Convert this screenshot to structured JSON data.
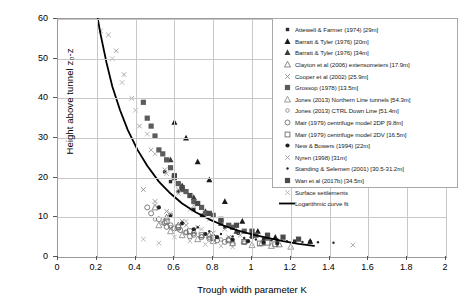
{
  "chart_data": {
    "type": "scatter",
    "title": "",
    "xlabel": "Trough  width  parameter K",
    "ylabel": "Height above tunnel z₀-z",
    "xlim": [
      0,
      2
    ],
    "ylim": [
      0,
      60
    ],
    "xticks": [
      "0",
      "0.2",
      "0.4",
      "0.6",
      "0.8",
      "1",
      "1.2",
      "1.4",
      "1.6",
      "1.8",
      "2"
    ],
    "yticks": [
      "0",
      "10",
      "20",
      "30",
      "40",
      "50",
      "60"
    ],
    "grid": true,
    "legend_position": "top-right",
    "series": [
      {
        "name": "Attewell & Farmer (1974) [29m]",
        "marker": "filled-square-small",
        "color": "#2b2b2b",
        "points": [
          [
            0.62,
            16.5
          ],
          [
            0.7,
            12.0
          ],
          [
            0.74,
            10.5
          ],
          [
            0.86,
            7.5
          ],
          [
            0.93,
            6.0
          ],
          [
            1.0,
            5.0
          ],
          [
            1.06,
            4.5
          ],
          [
            1.13,
            4.2
          ],
          [
            0.58,
            19.0
          ],
          [
            0.55,
            21.5
          ],
          [
            1.22,
            4.0
          ],
          [
            1.3,
            3.8
          ]
        ]
      },
      {
        "name": "Barratt & Tyler (1976) [20m]",
        "marker": "filled-triangle",
        "color": "#1a1a1a",
        "points": [
          [
            0.66,
            30.0
          ],
          [
            0.72,
            24.0
          ],
          [
            0.78,
            19.5
          ],
          [
            0.86,
            14.0
          ],
          [
            0.95,
            9.0
          ],
          [
            1.03,
            6.5
          ],
          [
            0.6,
            34.0
          ],
          [
            1.12,
            5.0
          ],
          [
            1.3,
            4.0
          ]
        ]
      },
      {
        "name": "Barratt & Tyler (1976) [34m]",
        "marker": "filled-triangle",
        "color": "#3a3a3a",
        "points": [
          [
            0.58,
            24.5
          ],
          [
            0.64,
            18.0
          ],
          [
            0.7,
            15.0
          ],
          [
            0.76,
            11.5
          ],
          [
            0.84,
            8.5
          ],
          [
            0.92,
            6.5
          ],
          [
            1.0,
            5.5
          ],
          [
            1.08,
            5.0
          ]
        ]
      },
      {
        "name": "Clayton et al (2006) extensometers [17.9m]",
        "marker": "open-triangle",
        "color": "#7a7a7a",
        "points": [
          [
            0.5,
            12.5
          ],
          [
            0.56,
            10.0
          ],
          [
            0.62,
            8.0
          ],
          [
            0.7,
            6.5
          ],
          [
            0.78,
            5.5
          ],
          [
            0.88,
            4.5
          ],
          [
            0.96,
            4.0
          ],
          [
            1.05,
            3.5
          ],
          [
            1.14,
            3.2
          ]
        ]
      },
      {
        "name": "Cooper et al (2002) [25.9m]",
        "marker": "x-small",
        "color": "#8a8a8a",
        "points": [
          [
            0.44,
            17.0
          ],
          [
            0.5,
            14.0
          ],
          [
            0.56,
            11.5
          ],
          [
            0.64,
            9.0
          ],
          [
            0.72,
            7.5
          ],
          [
            0.8,
            6.0
          ],
          [
            0.88,
            5.0
          ],
          [
            0.58,
            10.5
          ],
          [
            0.66,
            8.0
          ]
        ]
      },
      {
        "name": "Grossop (1978) [13.5m]",
        "marker": "filled-square",
        "color": "#5c5c5c",
        "points": [
          [
            0.46,
            35.0
          ],
          [
            0.5,
            30.5
          ],
          [
            0.52,
            27.0
          ],
          [
            0.56,
            24.5
          ],
          [
            0.58,
            22.5
          ],
          [
            0.6,
            20.0
          ],
          [
            0.62,
            18.5
          ],
          [
            0.66,
            16.5
          ],
          [
            0.7,
            14.0
          ],
          [
            0.74,
            12.5
          ],
          [
            0.8,
            10.5
          ],
          [
            0.84,
            9.0
          ],
          [
            0.9,
            7.5
          ],
          [
            0.96,
            6.5
          ],
          [
            1.02,
            5.5
          ],
          [
            0.44,
            39.0
          ],
          [
            0.48,
            33.0
          ],
          [
            0.54,
            26.0
          ],
          [
            0.64,
            17.0
          ],
          [
            0.76,
            11.0
          ],
          [
            0.88,
            8.0
          ]
        ]
      },
      {
        "name": "Jones (2013) Northern Line tunnels [54.3m]",
        "marker": "open-triangle",
        "color": "#909090",
        "points": [
          [
            0.52,
            8.0
          ],
          [
            0.58,
            6.5
          ],
          [
            0.64,
            5.5
          ],
          [
            0.72,
            4.5
          ],
          [
            0.8,
            4.0
          ],
          [
            0.9,
            3.5
          ],
          [
            1.0,
            3.0
          ],
          [
            1.1,
            2.8
          ],
          [
            1.2,
            2.6
          ]
        ]
      },
      {
        "name": "Jones (2013) CTRL Down Line [51.4m]",
        "marker": "open-circle-small",
        "color": "#7d7d7d",
        "points": [
          [
            0.5,
            9.5
          ],
          [
            0.54,
            8.5
          ],
          [
            0.58,
            7.5
          ],
          [
            0.62,
            7.0
          ],
          [
            0.66,
            6.2
          ],
          [
            0.7,
            5.8
          ],
          [
            0.74,
            5.2
          ],
          [
            0.78,
            4.8
          ],
          [
            0.84,
            4.4
          ],
          [
            0.9,
            4.0
          ],
          [
            0.96,
            3.6
          ]
        ]
      },
      {
        "name": "Mair (1979) centrifuge model 2DP [9.8m]",
        "marker": "open-circle",
        "color": "#6e6e6e",
        "points": [
          [
            0.48,
            11.0
          ],
          [
            0.52,
            9.5
          ],
          [
            0.55,
            8.6
          ],
          [
            0.58,
            8.0
          ],
          [
            0.6,
            7.2
          ],
          [
            0.63,
            6.8
          ],
          [
            0.66,
            6.2
          ],
          [
            0.7,
            5.6
          ],
          [
            0.74,
            5.0
          ],
          [
            0.78,
            4.6
          ],
          [
            0.82,
            4.2
          ],
          [
            0.86,
            3.8
          ],
          [
            0.9,
            3.4
          ],
          [
            0.46,
            12.5
          ],
          [
            0.56,
            7.6
          ],
          [
            0.68,
            5.2
          ]
        ]
      },
      {
        "name": "Mair (1979) centrifuge model 2DV [16.5m]",
        "marker": "open-square",
        "color": "#6e6e6e",
        "points": [
          [
            0.56,
            9.0
          ],
          [
            0.62,
            7.5
          ],
          [
            0.68,
            6.5
          ],
          [
            0.74,
            5.5
          ],
          [
            0.8,
            4.8
          ],
          [
            0.88,
            4.2
          ],
          [
            0.96,
            3.8
          ],
          [
            1.04,
            3.4
          ],
          [
            1.12,
            3.2
          ],
          [
            1.08,
            3.6
          ]
        ]
      },
      {
        "name": "New & Bowers (1994) [22m]",
        "marker": "filled-circle",
        "color": "#222222",
        "points": [
          [
            0.52,
            12.5
          ],
          [
            0.58,
            10.5
          ],
          [
            0.64,
            8.5
          ],
          [
            0.7,
            7.0
          ],
          [
            0.76,
            5.8
          ],
          [
            0.82,
            5.0
          ],
          [
            0.9,
            4.4
          ],
          [
            0.98,
            4.0
          ],
          [
            1.06,
            3.6
          ],
          [
            1.13,
            3.4
          ]
        ]
      },
      {
        "name": "Nyren (1998) [31m]",
        "marker": "x-small",
        "color": "#9e9e9e",
        "points": [
          [
            0.3,
            52.0
          ],
          [
            0.34,
            46.0
          ],
          [
            0.38,
            40.0
          ],
          [
            0.26,
            56.0
          ],
          [
            0.42,
            33.0
          ],
          [
            0.48,
            27.0
          ],
          [
            0.55,
            22.0
          ],
          [
            0.62,
            17.0
          ],
          [
            0.7,
            13.0
          ],
          [
            0.78,
            9.5
          ],
          [
            0.86,
            7.0
          ],
          [
            0.94,
            5.5
          ],
          [
            1.52,
            3.0
          ]
        ]
      },
      {
        "name": "Standing & Selemen (2001) [30.5-31.2m]",
        "marker": "dot",
        "color": "#2a2a2a",
        "points": [
          [
            0.78,
            6.5
          ],
          [
            0.84,
            5.8
          ],
          [
            0.9,
            5.2
          ],
          [
            0.96,
            4.8
          ],
          [
            1.02,
            4.4
          ],
          [
            1.1,
            4.2
          ],
          [
            1.18,
            4.0
          ],
          [
            1.26,
            3.8
          ],
          [
            1.34,
            3.7
          ],
          [
            1.42,
            3.6
          ],
          [
            0.72,
            7.5
          ]
        ]
      },
      {
        "name": "Wan et al (2017b) [34.5m]",
        "marker": "filled-square",
        "color": "#4a4a4a",
        "points": [
          [
            0.6,
            20.5
          ],
          [
            0.64,
            17.5
          ],
          [
            0.68,
            15.5
          ],
          [
            0.72,
            13.5
          ],
          [
            0.78,
            11.0
          ],
          [
            0.84,
            9.5
          ],
          [
            0.92,
            8.0
          ],
          [
            1.0,
            6.5
          ],
          [
            1.08,
            5.5
          ],
          [
            1.16,
            5.0
          ],
          [
            1.24,
            4.5
          ]
        ]
      },
      {
        "name": "Surface settlements",
        "marker": "x-small",
        "color": "#b0b0b0",
        "points": [
          [
            0.22,
            57.0
          ],
          [
            0.28,
            50.0
          ],
          [
            0.33,
            44.0
          ],
          [
            0.4,
            37.0
          ],
          [
            0.46,
            31.0
          ],
          [
            0.5,
            26.0
          ],
          [
            0.56,
            21.0
          ],
          [
            0.62,
            16.0
          ],
          [
            0.68,
            12.0
          ],
          [
            0.5,
            13.0
          ],
          [
            0.58,
            11.0
          ],
          [
            0.66,
            9.0
          ],
          [
            0.74,
            7.0
          ],
          [
            0.6,
            5.0
          ],
          [
            0.68,
            4.0
          ],
          [
            0.76,
            3.2
          ],
          [
            0.84,
            2.8
          ],
          [
            0.52,
            3.5
          ],
          [
            0.44,
            4.5
          ],
          [
            0.9,
            2.5
          ]
        ]
      }
    ],
    "fit": {
      "name": "Logarithmic curve fit",
      "color": "#000000",
      "points": [
        [
          0.205,
          60
        ],
        [
          0.22,
          56
        ],
        [
          0.25,
          49
        ],
        [
          0.28,
          43
        ],
        [
          0.32,
          37
        ],
        [
          0.36,
          32
        ],
        [
          0.41,
          27
        ],
        [
          0.46,
          23
        ],
        [
          0.52,
          19
        ],
        [
          0.58,
          16
        ],
        [
          0.64,
          13.5
        ],
        [
          0.71,
          11.3
        ],
        [
          0.78,
          9.5
        ],
        [
          0.85,
          8.0
        ],
        [
          0.92,
          6.8
        ],
        [
          1.0,
          5.7
        ],
        [
          1.08,
          4.8
        ],
        [
          1.16,
          4.0
        ],
        [
          1.24,
          3.3
        ],
        [
          1.32,
          2.8
        ]
      ]
    }
  },
  "legend": {
    "items": [
      {
        "label": "Attewell & Farmer (1974) [29m]",
        "marker": "filled-square-small",
        "color": "#2b2b2b"
      },
      {
        "label": "Barratt & Tyler (1976) [20m]",
        "marker": "filled-triangle",
        "color": "#1a1a1a"
      },
      {
        "label": "Barratt & Tyler (1976) [34m]",
        "marker": "filled-triangle",
        "color": "#3a3a3a"
      },
      {
        "label": "Clayton et al (2006) extensometers [17.9m]",
        "marker": "open-triangle",
        "color": "#7a7a7a"
      },
      {
        "label": "Cooper et al (2002) [25.9m]",
        "marker": "x-small",
        "color": "#8a8a8a"
      },
      {
        "label": "Grossop (1978) [13.5m]",
        "marker": "filled-square",
        "color": "#5c5c5c"
      },
      {
        "label": "Jones (2013) Northern Line tunnels [54.3m]",
        "marker": "open-triangle",
        "color": "#909090"
      },
      {
        "label": "Jones (2013) CTRL Down Line [51.4m]",
        "marker": "open-circle-small",
        "color": "#7d7d7d"
      },
      {
        "label": "Mair (1979) centrifuge model 2DP [9.8m]",
        "marker": "open-circle",
        "color": "#6e6e6e"
      },
      {
        "label": "Mair (1979) centrifuge model 2DV [16.5m]",
        "marker": "open-square",
        "color": "#6e6e6e"
      },
      {
        "label": "New & Bowers (1994) [22m]",
        "marker": "filled-circle",
        "color": "#222222"
      },
      {
        "label": "Nyren (1998) [31m]",
        "marker": "x-small",
        "color": "#9e9e9e"
      },
      {
        "label": "Standing & Selemen (2001) [30.5-31.2m]",
        "marker": "dot",
        "color": "#2a2a2a"
      },
      {
        "label": "Wan et al (2017b) [34.5m]",
        "marker": "filled-square",
        "color": "#4a4a4a"
      },
      {
        "label": "Surface settlements",
        "marker": "x-small",
        "color": "#b0b0b0"
      },
      {
        "label": "Logarithmic curve fit",
        "marker": "line",
        "color": "#000000"
      }
    ]
  }
}
